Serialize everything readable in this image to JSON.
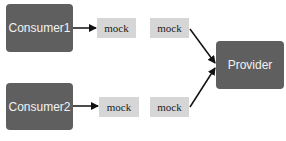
{
  "nodes": {
    "consumer1": "Consumer1",
    "consumer2": "Consumer2",
    "provider": "Provider",
    "mock_consumer1": "mock",
    "mock_consumer2": "mock",
    "mock_provider_top": "mock",
    "mock_provider_bottom": "mock"
  },
  "colors": {
    "dark_box": "#5f5f5f",
    "mock_box": "#d6d6d6",
    "arrow": "#111111"
  }
}
